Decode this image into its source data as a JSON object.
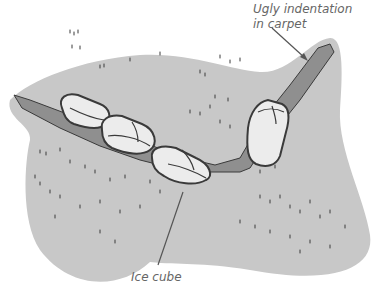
{
  "illustration": {
    "subject": "carpet-with-ice-cubes",
    "colors": {
      "carpet": "#c8c8c8",
      "indentation": "#8f8f8f",
      "ice_fill": "#ececec",
      "outline": "#3a3a3a",
      "label_text": "#666666",
      "leader_line": "#555555"
    },
    "ice_cube_count": 4
  },
  "labels": {
    "indentation": {
      "line1": "Ugly indentation",
      "line2": "in carpet"
    },
    "ice_cube": "Ice cube"
  }
}
